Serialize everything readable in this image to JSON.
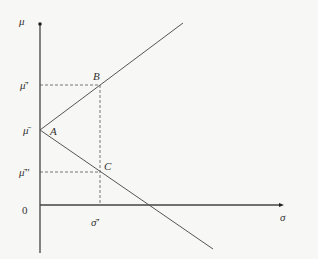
{
  "diagram": {
    "axes": {
      "y_label": "μ",
      "x_label": "σ",
      "origin_label": "0"
    },
    "points": {
      "A": "A",
      "B": "B",
      "C": "C"
    },
    "y_ticks": {
      "mu_bar": "μ̄",
      "mu_bar_prime": "μ̄'",
      "mu_bar_double_prime": "μ̄''"
    },
    "x_ticks": {
      "sigma_bar_prime": "σ̄'"
    },
    "colors": {
      "line": "#444444",
      "background": "#f7f7f5"
    }
  }
}
